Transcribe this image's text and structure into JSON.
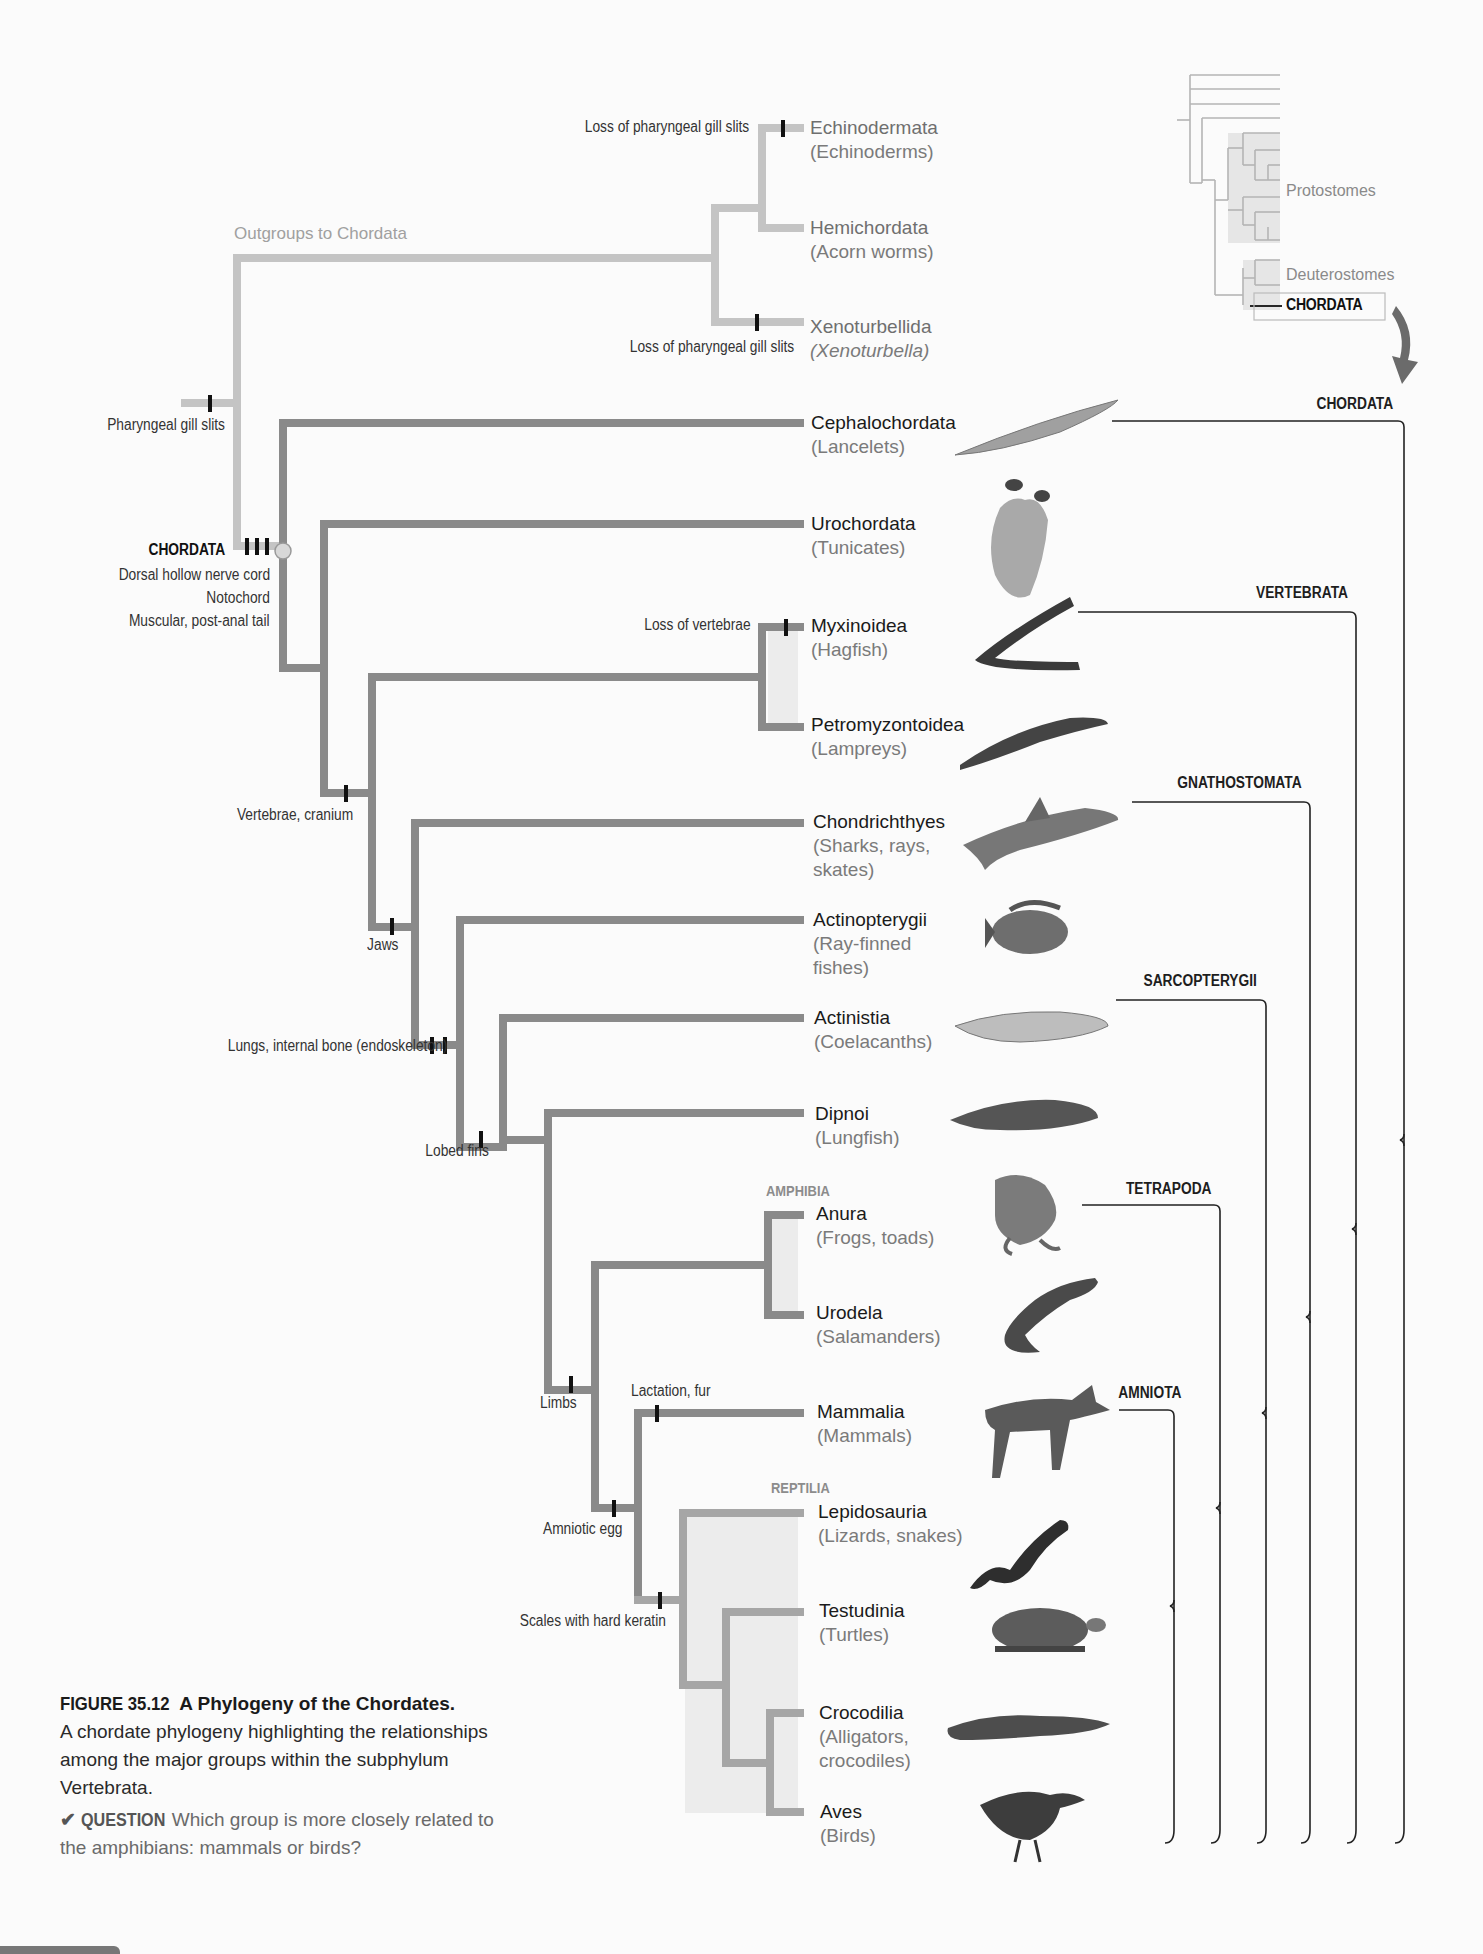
{
  "figure": {
    "number": "FIGURE 35.12",
    "title": "A Phylogeny of the Chordates.",
    "description": "A chordate phylogeny highlighting the relationships among the major groups within the subphylum Vertebrata.",
    "question_label": "QUESTION",
    "question_text": "Which group is more closely related to the amphibians: mammals or birds?"
  },
  "colors": {
    "branch_dark": "#8a8a8a",
    "branch_light": "#c4c4c4",
    "highlight_fill": "#ececec",
    "text_primary": "#1a1a1a",
    "text_secondary": "#7a7a7a",
    "bracket": "#222222",
    "arrow": "#6b6b6b"
  },
  "inset": {
    "labels": [
      "Protostomes",
      "Deuterostomes",
      "CHORDATA"
    ]
  },
  "outgroups": {
    "label": "Outgroups to Chordata",
    "taxa": [
      {
        "name": "Echinodermata",
        "common": "(Echinoderms)"
      },
      {
        "name": "Hemichordata",
        "common": "(Acorn worms)"
      },
      {
        "name": "Xenoturbellida",
        "common": "(Xenoturbella)"
      }
    ]
  },
  "characters": {
    "pharyngeal_gill_slits": "Pharyngeal gill slits",
    "loss_gill_slits_top": "Loss of pharyngeal gill slits",
    "loss_gill_slits_bottom": "Loss of pharyngeal gill slits",
    "chordata_name": "CHORDATA",
    "chordata_traits": [
      "Dorsal hollow nerve cord",
      "Notochord",
      "Muscular, post-anal tail"
    ],
    "loss_vertebrae": "Loss of vertebrae",
    "vertebrae_cranium": "Vertebrae, cranium",
    "jaws": "Jaws",
    "lungs_bone": "Lungs, internal bone (endoskeleton)",
    "lobed_fins": "Lobed fins",
    "limbs": "Limbs",
    "lactation_fur": "Lactation, fur",
    "amniotic_egg": "Amniotic egg",
    "scales_keratin": "Scales with hard keratin"
  },
  "groups": {
    "amphibia": "AMPHIBIA",
    "reptilia": "REPTILIA"
  },
  "taxa": [
    {
      "name": "Cephalochordata",
      "common": "(Lancelets)",
      "icon": "lancelet-icon"
    },
    {
      "name": "Urochordata",
      "common": "(Tunicates)",
      "icon": "tunicate-icon"
    },
    {
      "name": "Myxinoidea",
      "common": "(Hagfish)",
      "icon": "hagfish-icon"
    },
    {
      "name": "Petromyzontoidea",
      "common": "(Lampreys)",
      "icon": "lamprey-icon"
    },
    {
      "name": "Chondrichthyes",
      "common": "(Sharks, rays, skates)",
      "common_lines": [
        "(Sharks, rays,",
        "skates)"
      ],
      "icon": "shark-icon"
    },
    {
      "name": "Actinopterygii",
      "common": "(Ray-finned fishes)",
      "common_lines": [
        "(Ray-finned",
        "fishes)"
      ],
      "icon": "ray-finned-fish-icon"
    },
    {
      "name": "Actinistia",
      "common": "(Coelacanths)",
      "icon": "coelacanth-icon"
    },
    {
      "name": "Dipnoi",
      "common": "(Lungfish)",
      "icon": "lungfish-icon"
    },
    {
      "name": "Anura",
      "common": "(Frogs, toads)",
      "icon": "frog-icon"
    },
    {
      "name": "Urodela",
      "common": "(Salamanders)",
      "icon": "salamander-icon"
    },
    {
      "name": "Mammalia",
      "common": "(Mammals)",
      "icon": "deer-icon"
    },
    {
      "name": "Lepidosauria",
      "common": "(Lizards, snakes)",
      "icon": "snake-icon"
    },
    {
      "name": "Testudinia",
      "common": "(Turtles)",
      "icon": "turtle-icon"
    },
    {
      "name": "Crocodilia",
      "common": "(Alligators, crocodiles)",
      "common_lines": [
        "(Alligators,",
        "crocodiles)"
      ],
      "icon": "alligator-icon"
    },
    {
      "name": "Aves",
      "common": "(Birds)",
      "icon": "bird-icon"
    }
  ],
  "clades": [
    {
      "name": "CHORDATA"
    },
    {
      "name": "VERTEBRATA"
    },
    {
      "name": "GNATHOSTOMATA"
    },
    {
      "name": "SARCOPTERYGII"
    },
    {
      "name": "TETRAPODA"
    },
    {
      "name": "AMNIOTA"
    }
  ]
}
